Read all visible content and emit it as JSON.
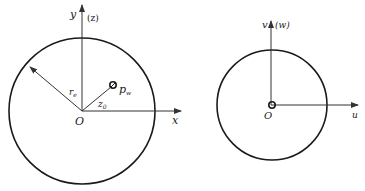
{
  "diagram": {
    "left": {
      "axis_y_label": "y",
      "axis_y_paren": "(z)",
      "axis_x_label": "x",
      "origin_label": "O",
      "radius_label": "r",
      "radius_subscript": "e",
      "offset_label": "z",
      "offset_subscript": "0",
      "point_label": "p",
      "point_subscript": "w"
    },
    "right": {
      "axis_v_label": "v",
      "axis_v_paren": "(w)",
      "axis_u_label": "u",
      "origin_label": "O"
    },
    "colors": {
      "line": "#1a1a1a",
      "axis": "#333333"
    }
  }
}
